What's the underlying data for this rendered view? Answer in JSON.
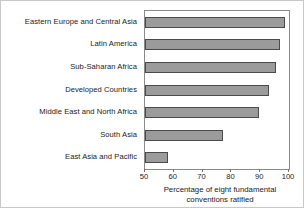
{
  "chart_data": {
    "type": "bar",
    "orientation": "horizontal",
    "title": "",
    "xlabel_line1": "Percentage of eight fundamental",
    "xlabel_line2": "conventions ratified",
    "ylabel": "",
    "xlim": [
      50,
      100
    ],
    "xticks": [
      50,
      60,
      70,
      80,
      90,
      100
    ],
    "xtick_labels": [
      "50",
      "60",
      "70",
      "80",
      "90",
      "100"
    ],
    "grid": false,
    "legend": false,
    "categories": [
      "Eastern Europe and Central Asia",
      "Latin America",
      "Sub-Saharan Africa",
      "Developed Countries",
      "Middle East and North Africa",
      "South Asia",
      "East Asia and Pacific"
    ],
    "values": [
      98.5,
      97.0,
      95.5,
      93.0,
      89.5,
      77.0,
      58.0
    ],
    "bar_fill_color": "#9b9b9b",
    "bar_edge_color": "#4a4a4a",
    "plot_border_color": "#8a8a8a",
    "background_color": "#ffffff",
    "text_color": "#1a1a1a"
  }
}
